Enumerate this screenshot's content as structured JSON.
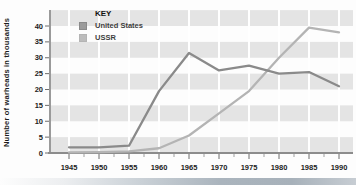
{
  "chart_data": {
    "type": "line",
    "title": "",
    "ylabel": "Number of warheads in thousands",
    "xlabel": "",
    "categories": [
      1945,
      1950,
      1955,
      1960,
      1965,
      1970,
      1975,
      1980,
      1985,
      1990
    ],
    "series": [
      {
        "name": "United States",
        "color": "#8a8a8a",
        "swatch_color": "#9b9b9b",
        "values": [
          1.8,
          1.8,
          2.3,
          19.5,
          31.5,
          26,
          27.5,
          25,
          25.5,
          21
        ]
      },
      {
        "name": "USSR",
        "color": "#b4b4b4",
        "swatch_color": "#bcbcbc",
        "values": [
          0.2,
          0.3,
          0.5,
          1.5,
          5.5,
          12.5,
          19.5,
          30,
          39.5,
          38
        ]
      }
    ],
    "ylim": [
      0,
      45
    ],
    "yticks": [
      0,
      5,
      10,
      15,
      20,
      25,
      30,
      35,
      40
    ],
    "legend": {
      "title": "KEY",
      "position": "top-left"
    },
    "grid": {
      "style": "horizontal alternating stripes with white vertical gridlines",
      "stripe_color": "#e4e4e4",
      "gridline_color": "#ffffff"
    },
    "colors": {
      "axis": "#8c8c8c",
      "tick_text": "#222222",
      "bottom_bar": "#aab4bd"
    }
  }
}
